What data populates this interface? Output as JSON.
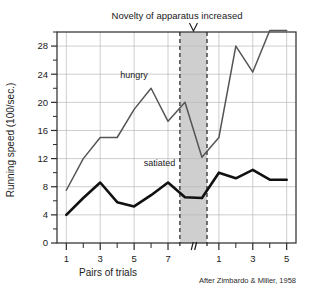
{
  "chart_data": {
    "type": "line",
    "title": "Novelty of apparatus increased",
    "xlabel": "Pairs of trials",
    "ylabel": "Running speed (100/sec.)",
    "credit": "After Zimbardo & Miller, 1958",
    "ylim": [
      0,
      30
    ],
    "yticks": [
      0,
      4,
      8,
      12,
      16,
      20,
      24,
      28
    ],
    "ytick_labels": [
      "0",
      "4",
      "8",
      "12",
      "16",
      "20",
      "24",
      "28"
    ],
    "yminor_ticks": [
      2,
      6,
      10,
      14,
      18,
      22,
      26,
      30
    ],
    "grid": true,
    "legend_position": "inline-annotations",
    "axis_break": true,
    "axis_break_label": "//",
    "shaded_region": {
      "label": "novelty-period",
      "x_start": 7.7,
      "x_end": 9.3,
      "color": "#cfcfcf"
    },
    "marker_arrow": "V",
    "xticks_segment1": [
      1,
      2,
      3,
      4,
      5,
      6,
      7
    ],
    "xtick_labels_segment1": [
      "1",
      "",
      "3",
      "",
      "5",
      "",
      "7"
    ],
    "xticks_segment2": [
      1,
      2,
      3,
      4,
      5
    ],
    "xtick_labels_segment2": [
      "1",
      "",
      "3",
      "",
      "5"
    ],
    "series": [
      {
        "name": "hungry",
        "color": "#555555",
        "label_text": "hungry",
        "x": [
          1,
          2,
          3,
          4,
          5,
          6,
          7,
          8,
          9,
          10,
          11,
          12,
          13,
          14
        ],
        "values": [
          7.5,
          12.0,
          15.0,
          15.0,
          19.0,
          22.0,
          17.3,
          20.0,
          12.2,
          15.0,
          28.0,
          24.3,
          30.2,
          30.2
        ]
      },
      {
        "name": "satiated",
        "color": "#111111",
        "label_text": "satiated",
        "x": [
          1,
          2,
          3,
          4,
          5,
          6,
          7,
          8,
          9,
          10,
          11,
          12,
          13,
          14
        ],
        "values": [
          4.0,
          6.4,
          8.6,
          5.8,
          5.2,
          6.8,
          8.6,
          6.5,
          6.4,
          10.0,
          9.2,
          10.4,
          9.0,
          9.0
        ]
      }
    ]
  }
}
